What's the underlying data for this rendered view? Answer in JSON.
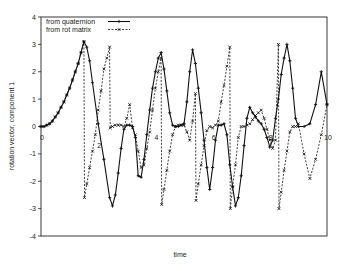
{
  "chart_data": {
    "type": "line",
    "title": "",
    "xlabel": "time",
    "ylabel": "rotation vector, component 1",
    "ylim": [
      -4,
      4
    ],
    "xlim": [
      0,
      10
    ],
    "yticks": [
      -4,
      -3,
      -2,
      -1,
      0,
      1,
      2,
      3,
      4
    ],
    "yticklabels": [
      "-4",
      "-3",
      "-2",
      "-1",
      "0",
      "1",
      "2",
      "3",
      "4"
    ],
    "grid": false,
    "legend_position": "upper left",
    "annotations": [
      {
        "text": "0",
        "x": 0,
        "y": -0.2
      },
      {
        "text": "2",
        "x": 2,
        "y": -0.5
      },
      {
        "text": "4",
        "x": 4,
        "y": -0.2
      },
      {
        "text": "6",
        "x": 6,
        "y": -0.2
      },
      {
        "text": "8",
        "x": 8,
        "y": -0.2
      },
      {
        "text": "10",
        "x": 10,
        "y": -0.2
      }
    ],
    "series": [
      {
        "name": "from quaternion",
        "style": "solid",
        "marker": "+",
        "x": [
          0,
          0.1,
          0.2,
          0.3,
          0.4,
          0.5,
          0.6,
          0.7,
          0.8,
          0.9,
          1.0,
          1.1,
          1.2,
          1.3,
          1.4,
          1.5,
          1.6,
          1.7,
          1.8,
          2.0,
          2.2,
          2.4,
          2.5,
          2.6,
          2.7,
          2.8,
          2.9,
          3.0,
          3.1,
          3.2,
          3.3,
          3.4,
          3.5,
          3.6,
          3.7,
          3.8,
          3.9,
          4.0,
          4.1,
          4.2,
          4.3,
          4.4,
          4.5,
          4.6,
          4.7,
          4.8,
          4.9,
          5.0,
          5.1,
          5.2,
          5.3,
          5.4,
          5.5,
          5.6,
          5.7,
          5.8,
          5.9,
          6.0,
          6.1,
          6.2,
          6.3,
          6.4,
          6.5,
          6.6,
          6.7,
          6.8,
          6.9,
          7.0,
          7.1,
          7.2,
          7.3,
          7.4,
          7.5,
          7.6,
          7.7,
          7.8,
          7.9,
          8.0,
          8.1,
          8.2,
          8.3,
          8.4,
          8.5,
          8.6,
          8.7,
          8.8,
          8.9,
          9.0,
          9.2,
          9.4,
          9.6,
          9.8,
          10.0
        ],
        "y": [
          0,
          0,
          0.05,
          0.1,
          0.2,
          0.35,
          0.5,
          0.7,
          0.9,
          1.15,
          1.4,
          1.7,
          2.0,
          2.3,
          2.7,
          3.1,
          2.9,
          2.4,
          1.6,
          0.1,
          -1.2,
          -2.6,
          -2.9,
          -2.5,
          -1.7,
          -0.8,
          -0.1,
          0.05,
          0.05,
          0.0,
          -0.4,
          -1.8,
          -1.85,
          -1.2,
          -0.3,
          0.6,
          1.4,
          2.0,
          2.5,
          2.7,
          2.1,
          1.3,
          0.5,
          0.05,
          0.0,
          0.0,
          0.05,
          0.1,
          0.9,
          2.0,
          2.8,
          2.3,
          1.4,
          0.5,
          -0.5,
          -1.5,
          -2.3,
          -1.5,
          -0.5,
          0.05,
          0.05,
          0.1,
          -0.3,
          -1.4,
          -2.2,
          -2.9,
          -2.6,
          -1.8,
          -0.7,
          0.3,
          0.7,
          0.5,
          0.35,
          0.2,
          0.1,
          -0.1,
          -0.4,
          -0.75,
          -0.5,
          0.3,
          1.0,
          1.9,
          2.5,
          3.0,
          2.4,
          1.4,
          0.3,
          0.0,
          0.0,
          0.1,
          0.8,
          2.0,
          0.8
        ],
        "color": "#111111"
      },
      {
        "name": "from rot matrix",
        "style": "dashed",
        "marker": "x",
        "x": [
          0,
          0.1,
          0.2,
          0.3,
          0.4,
          0.5,
          0.6,
          0.7,
          0.8,
          0.9,
          1.0,
          1.1,
          1.2,
          1.3,
          1.4,
          1.5,
          1.52,
          1.6,
          1.7,
          1.8,
          1.9,
          2.0,
          2.1,
          2.2,
          2.3,
          2.4,
          2.42,
          2.5,
          2.6,
          2.7,
          2.8,
          2.9,
          3.0,
          3.1,
          3.2,
          3.3,
          3.4,
          3.5,
          3.6,
          3.7,
          3.8,
          3.9,
          4.0,
          4.1,
          4.2,
          4.22,
          4.3,
          4.4,
          4.5,
          4.6,
          4.7,
          4.8,
          4.9,
          5.0,
          5.1,
          5.2,
          5.3,
          5.4,
          5.42,
          5.5,
          5.6,
          5.7,
          5.8,
          5.9,
          6.0,
          6.1,
          6.2,
          6.3,
          6.4,
          6.5,
          6.6,
          6.62,
          6.7,
          6.8,
          6.9,
          7.0,
          7.1,
          7.2,
          7.3,
          7.4,
          7.5,
          7.6,
          7.7,
          7.8,
          7.9,
          8.0,
          8.1,
          8.2,
          8.3,
          8.32,
          8.4,
          8.5,
          8.6,
          8.7,
          8.8,
          8.9,
          9.0,
          9.2,
          9.4,
          9.6,
          9.8,
          10.0
        ],
        "y": [
          0,
          0,
          0.05,
          0.1,
          0.2,
          0.35,
          0.5,
          0.7,
          0.9,
          1.15,
          1.4,
          1.7,
          2.0,
          2.3,
          2.7,
          3.1,
          -2.6,
          -2.1,
          -1.5,
          -0.9,
          -0.3,
          0.6,
          1.3,
          2.1,
          2.5,
          2.9,
          -0.05,
          0.0,
          0.05,
          0.05,
          0.05,
          0.0,
          0.3,
          0.8,
          -0.05,
          -0.3,
          -0.9,
          -1.5,
          -1.4,
          -0.8,
          -0.2,
          0.6,
          1.4,
          2.0,
          2.5,
          -2.85,
          -2.3,
          -1.6,
          -0.9,
          -0.3,
          0.0,
          0.05,
          0.05,
          0.05,
          -0.2,
          -0.5,
          0.2,
          1.2,
          -2.7,
          -2.1,
          -1.4,
          -0.7,
          -0.15,
          0.0,
          -0.05,
          0.05,
          0.2,
          0.9,
          1.5,
          2.2,
          2.9,
          -3.0,
          -2.2,
          -1.4,
          -0.4,
          0.0,
          0.0,
          0.05,
          0.1,
          0.25,
          0.4,
          0.5,
          0.6,
          0.3,
          -0.1,
          -0.5,
          -0.8,
          -0.5,
          3.0,
          -3.0,
          -2.4,
          -1.6,
          -0.9,
          -0.2,
          0.0,
          0.0,
          0.1,
          -1.0,
          -1.9,
          -1.2,
          -0.3,
          0.8
        ],
        "color": "#111111"
      }
    ]
  },
  "legend": {
    "items": [
      {
        "label": "from quaternion",
        "style": "solid",
        "marker": "+"
      },
      {
        "label": "from rot matrix",
        "style": "dashed",
        "marker": "x"
      }
    ]
  },
  "axes": {
    "xlabel": "time",
    "ylabel": "rotation vector, component 1"
  }
}
